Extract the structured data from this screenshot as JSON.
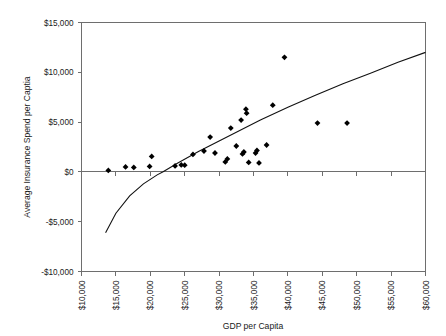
{
  "chart_data": {
    "type": "scatter",
    "title": "",
    "xlabel": "GDP per Capita",
    "ylabel": "Average Insurance Spend per Captia",
    "xlim": [
      10000,
      60000
    ],
    "ylim": [
      -10000,
      15000
    ],
    "xticks": [
      10000,
      15000,
      20000,
      25000,
      30000,
      35000,
      40000,
      45000,
      50000,
      55000,
      60000
    ],
    "yticks": [
      -10000,
      -5000,
      0,
      5000,
      10000,
      15000
    ],
    "xticklabels": [
      "$10,000",
      "$15,000",
      "$20,000",
      "$25,000",
      "$30,000",
      "$35,000",
      "$40,000",
      "$45,000",
      "$50,000",
      "$55,000",
      "$60,000"
    ],
    "yticklabels": [
      "-$10,000",
      "-$5,000",
      "$0",
      "$5,000",
      "$10,000",
      "$15,000"
    ],
    "grid": false,
    "legend": null,
    "marker": "diamond",
    "marker_color": "#000000",
    "points": [
      {
        "x": 13900,
        "y": 150
      },
      {
        "x": 16400,
        "y": 500
      },
      {
        "x": 17600,
        "y": 450
      },
      {
        "x": 19900,
        "y": 550
      },
      {
        "x": 20200,
        "y": 1550
      },
      {
        "x": 23600,
        "y": 600
      },
      {
        "x": 24500,
        "y": 700
      },
      {
        "x": 25000,
        "y": 680
      },
      {
        "x": 26200,
        "y": 1750
      },
      {
        "x": 27800,
        "y": 2100
      },
      {
        "x": 28700,
        "y": 3500
      },
      {
        "x": 29400,
        "y": 1900
      },
      {
        "x": 30900,
        "y": 1000
      },
      {
        "x": 31200,
        "y": 1300
      },
      {
        "x": 31700,
        "y": 4400
      },
      {
        "x": 32500,
        "y": 2600
      },
      {
        "x": 33200,
        "y": 5200
      },
      {
        "x": 33400,
        "y": 1800
      },
      {
        "x": 33600,
        "y": 2000
      },
      {
        "x": 33900,
        "y": 6300
      },
      {
        "x": 34000,
        "y": 5900
      },
      {
        "x": 34300,
        "y": 950
      },
      {
        "x": 35300,
        "y": 1900
      },
      {
        "x": 35500,
        "y": 2150
      },
      {
        "x": 35800,
        "y": 900
      },
      {
        "x": 36900,
        "y": 2700
      },
      {
        "x": 37800,
        "y": 6700
      },
      {
        "x": 39500,
        "y": 11500
      },
      {
        "x": 44300,
        "y": 4900
      },
      {
        "x": 48600,
        "y": 4900
      }
    ],
    "trendline": {
      "type": "logarithmic",
      "description": "Fitted log trend curve rising from about -$6,100 at $13,500 GDP to about $12,000 at $60,000 GDP",
      "x_start": 13500,
      "y_start": -6100,
      "x_end": 60000,
      "y_end": 12000,
      "crosses_zero_at_x": 21800,
      "samples": [
        {
          "x": 13500,
          "y": -6100
        },
        {
          "x": 15000,
          "y": -4150
        },
        {
          "x": 17000,
          "y": -2400
        },
        {
          "x": 19000,
          "y": -1200
        },
        {
          "x": 21000,
          "y": -300
        },
        {
          "x": 21800,
          "y": 0
        },
        {
          "x": 24000,
          "y": 900
        },
        {
          "x": 27000,
          "y": 2050
        },
        {
          "x": 30000,
          "y": 3100
        },
        {
          "x": 33000,
          "y": 4150
        },
        {
          "x": 36000,
          "y": 5200
        },
        {
          "x": 40000,
          "y": 6500
        },
        {
          "x": 44000,
          "y": 7700
        },
        {
          "x": 48000,
          "y": 8850
        },
        {
          "x": 52000,
          "y": 9900
        },
        {
          "x": 56000,
          "y": 11000
        },
        {
          "x": 60000,
          "y": 12000
        }
      ]
    }
  },
  "colors": {
    "axis": "#6e6e6e",
    "trend": "#111111",
    "marker": "#000000",
    "text": "#1a1a1a",
    "background": "#ffffff"
  }
}
